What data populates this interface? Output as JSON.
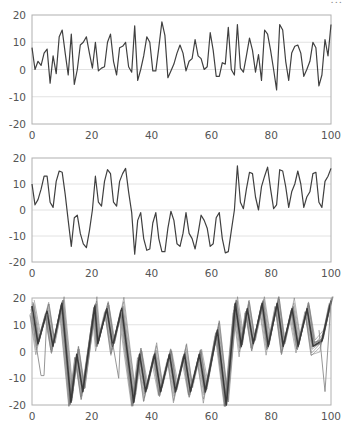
{
  "header": {
    "cut_text": "..."
  },
  "colors": {
    "line": "#404040",
    "frame": "#b0b0b0",
    "grid": "#e2e2e2",
    "band": "#7a7a7a",
    "tick_text": "#555555"
  },
  "chart_data": [
    {
      "type": "line",
      "title": "",
      "xlabel": "",
      "ylabel": "",
      "xlim": [
        0,
        100
      ],
      "ylim": [
        -20,
        20
      ],
      "xticks": [
        0,
        20,
        40,
        60,
        80,
        100
      ],
      "yticks": [
        20,
        10,
        0,
        -10,
        -20
      ],
      "grid": "horizontal",
      "series": [
        {
          "name": "series-1",
          "values": [
            8,
            0,
            3,
            1.5,
            6,
            7.5,
            -5,
            5,
            -1.5,
            12,
            14.5,
            6,
            -2,
            13,
            -5.5,
            0,
            9,
            10,
            12,
            6,
            0.5,
            10,
            -0.5,
            0.5,
            1,
            10,
            13,
            3,
            -2,
            8,
            8.5,
            10,
            1,
            -1,
            16,
            -4,
            0,
            5,
            12,
            10,
            -0.5,
            -0.5,
            8,
            17.5,
            12.5,
            -3,
            -0.5,
            2,
            6,
            9,
            6,
            -0.5,
            3,
            4,
            11,
            5,
            4,
            0,
            1,
            13.5,
            7,
            -2.5,
            -2.5,
            2.5,
            2,
            15.5,
            0,
            -2,
            16.5,
            0.5,
            -1,
            5,
            11.5,
            7,
            -1,
            5.5,
            -4,
            14.5,
            13,
            7,
            0,
            -7.5,
            16.5,
            14.5,
            3,
            -4,
            6,
            8.5,
            9,
            6,
            -2.5,
            0,
            3,
            10,
            8,
            -6,
            -2,
            11,
            5,
            16.5
          ]
        }
      ]
    },
    {
      "type": "line",
      "title": "",
      "xlabel": "",
      "ylabel": "",
      "xlim": [
        0,
        100
      ],
      "ylim": [
        -20,
        20
      ],
      "xticks": [
        0,
        20,
        40,
        60,
        80,
        100
      ],
      "yticks": [
        20,
        10,
        0,
        -10,
        -20
      ],
      "grid": "horizontal",
      "series": [
        {
          "name": "series-2",
          "values": [
            10,
            2,
            4,
            8,
            13,
            13,
            3,
            1,
            11,
            15,
            14.5,
            6,
            -4,
            -14,
            -3,
            -2,
            -9,
            -13,
            -14.5,
            -8,
            0,
            13,
            3,
            1.5,
            11,
            15.5,
            14,
            3,
            1.5,
            11,
            14,
            16,
            7,
            -1,
            -17,
            -4,
            -1,
            -11,
            -15.5,
            -15,
            -5,
            -1,
            -11,
            -16,
            -16,
            -7,
            -0.5,
            -4,
            -13,
            -14,
            -9,
            -1,
            -9,
            -11,
            -15,
            -9,
            -2,
            -4,
            -7,
            -14,
            -13,
            -3,
            -1,
            -11,
            -16.5,
            -16,
            -8,
            0,
            17,
            3,
            0.5,
            8,
            14.5,
            14,
            5,
            0,
            9,
            13,
            16.5,
            8,
            0.5,
            2,
            15.5,
            15,
            9,
            1,
            7,
            10,
            15,
            10,
            1,
            5,
            7,
            14,
            14.5,
            3,
            1,
            11,
            13,
            16
          ]
        }
      ]
    },
    {
      "type": "line",
      "title": "",
      "xlabel": "",
      "ylabel": "",
      "xlim": [
        0,
        100
      ],
      "ylim": [
        -20,
        20
      ],
      "xticks": [
        0,
        20,
        40,
        60,
        80,
        100
      ],
      "yticks": [
        20,
        10,
        0,
        -10,
        -20
      ],
      "grid": "horizontal",
      "note": "ensemble of many overlapping trajectories (gray band) around a triangle-wave mean",
      "series": [
        {
          "name": "ensemble-mean",
          "x": [
            0,
            2,
            5,
            7,
            10,
            13,
            15,
            17,
            21,
            22,
            25,
            27,
            30,
            34,
            36,
            38,
            41,
            43,
            46,
            48,
            51,
            53,
            56,
            58,
            62,
            65,
            68,
            70,
            72,
            74,
            77,
            79,
            82,
            84,
            87,
            89,
            92,
            94,
            97,
            100
          ],
          "values": [
            17,
            3,
            15,
            2,
            18,
            -19,
            -1,
            -15,
            17,
            3,
            16,
            2,
            16,
            -19,
            -1,
            -15,
            -1,
            -15,
            -1,
            -15,
            -1,
            -15,
            -1,
            -15,
            8,
            -20,
            18,
            2,
            16,
            3,
            18,
            2,
            18,
            2,
            16,
            2,
            16,
            2,
            4,
            19
          ]
        },
        {
          "name": "outlier-trace",
          "x": [
            0,
            1,
            3,
            4,
            5
          ],
          "values": [
            15,
            5,
            -9,
            -9,
            14
          ]
        },
        {
          "name": "outlier-trace-2",
          "x": [
            27,
            29,
            30
          ],
          "values": [
            3,
            -10,
            15
          ]
        },
        {
          "name": "outlier-trace-3",
          "x": [
            96,
            98,
            100
          ],
          "values": [
            8,
            -15,
            19
          ]
        }
      ]
    }
  ]
}
